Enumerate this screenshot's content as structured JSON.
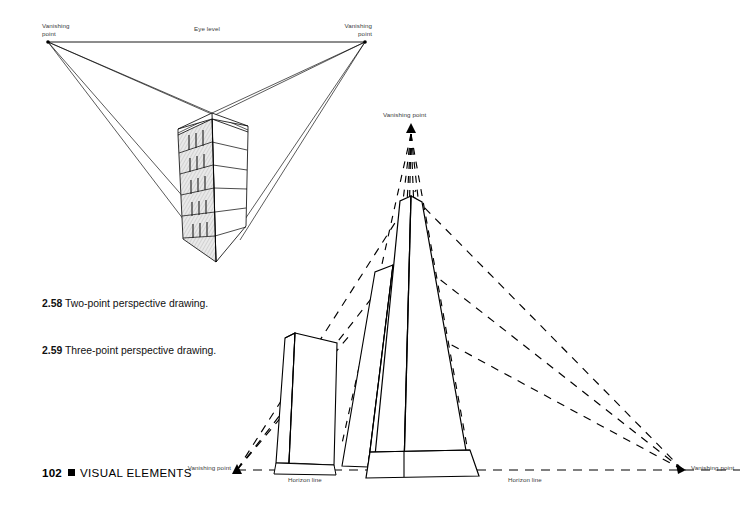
{
  "page": {
    "number": "102",
    "section_title": "VISUAL ELEMENTS",
    "bullet": "square-bullet",
    "background_color": "#ffffff",
    "ink_color": "#000000",
    "label_color": "#3b3b3b"
  },
  "figures": [
    {
      "id": "2.58",
      "number": "2.58",
      "caption": "Two-point perspective drawing.",
      "type": "two-point-perspective",
      "labels": {
        "left_vanishing_point": "Vanishing\npoint",
        "right_vanishing_point": "Vanishing\npoint",
        "eye_level": "Eye level"
      },
      "geometry": {
        "left_vp": [
          48,
          42
        ],
        "right_vp": [
          365,
          42
        ],
        "horizon_y": 42,
        "box_top_corner": [
          212,
          113
        ],
        "box_bottom_corner": [
          216,
          262
        ],
        "floors": 6
      }
    },
    {
      "id": "2.59",
      "number": "2.59",
      "caption": "Three-point perspective drawing.",
      "type": "three-point-perspective",
      "labels": {
        "top_vanishing_point": "Vanishing point",
        "left_vanishing_point": "Vanishing point",
        "right_vanishing_point": "Vanishing point",
        "horizon_line_left": "Horizon line",
        "horizon_line_right": "Horizon line"
      },
      "geometry": {
        "top_vp": [
          411,
          129
        ],
        "left_vp": [
          237,
          470
        ],
        "right_vp": [
          683,
          470
        ],
        "horizon_y": 470,
        "tower_apex": [
          411,
          196
        ],
        "towers": 3
      }
    }
  ],
  "markers": {
    "triangle": "triangle-marker",
    "dash_pattern": "dashed-guide-line",
    "solid_pattern": "solid-construction-line"
  }
}
